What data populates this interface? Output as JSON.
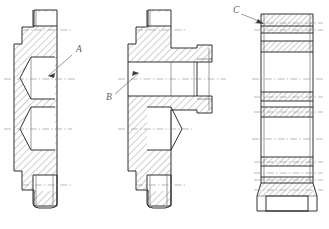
{
  "drawing": {
    "title": "Mechanical Part Sectional Views",
    "background_color": "#ffffff",
    "line_color": "#1a1a1a",
    "thin_line_color": "#4a4a4a",
    "centerline_color": "#8a8a8a",
    "hatch_color": "#3a3a3a",
    "label_color": "#5f5f5f",
    "canvas": {
      "width": 329,
      "height": 229
    }
  },
  "labels": [
    {
      "id": "A",
      "text": "A",
      "x": 76,
      "y": 52,
      "leader_from_x": 72,
      "leader_from_y": 55,
      "leader_to_x": 48,
      "leader_to_y": 76
    },
    {
      "id": "B",
      "text": "B",
      "x": 108,
      "y": 98,
      "leader_from_x": 115,
      "leader_from_y": 94,
      "leader_to_x": 139,
      "leader_to_y": 73
    },
    {
      "id": "C",
      "text": "C",
      "x": 236,
      "y": 12,
      "leader_from_x": 241,
      "leader_from_y": 14,
      "leader_to_x": 263,
      "leader_to_y": 23
    }
  ],
  "figures": [
    {
      "name": "left-flange-section",
      "label_ref": "A",
      "description": "Half sectional view of flange with two tapered bores",
      "centerlines_y": [
        30,
        79,
        129,
        185
      ],
      "hatch_angle_deg": 45,
      "bounds": {
        "x": 14,
        "y": 10,
        "width": 56,
        "height": 200
      }
    },
    {
      "name": "middle-flange-hub-section",
      "label_ref": "B",
      "description": "Half sectional view of flange with protruding cylindrical hub and bore",
      "centerlines_y": [
        30,
        79,
        129,
        185
      ],
      "hatch_angle_deg": 45,
      "bounds": {
        "x": 128,
        "y": 10,
        "width": 90,
        "height": 200
      }
    },
    {
      "name": "right-cylinder-section",
      "label_ref": "C",
      "description": "Front view of cylindrical body with horizontal banded sections",
      "centerlines_y": [
        23,
        40,
        79,
        101,
        112,
        143,
        165,
        180,
        195
      ],
      "hatch_angle_deg": 45,
      "bounds": {
        "x": 258,
        "y": 13,
        "width": 58,
        "height": 202
      }
    }
  ],
  "icons": {
    "arrowhead": "arrow-head-icon",
    "leader": "leader-line-icon"
  }
}
